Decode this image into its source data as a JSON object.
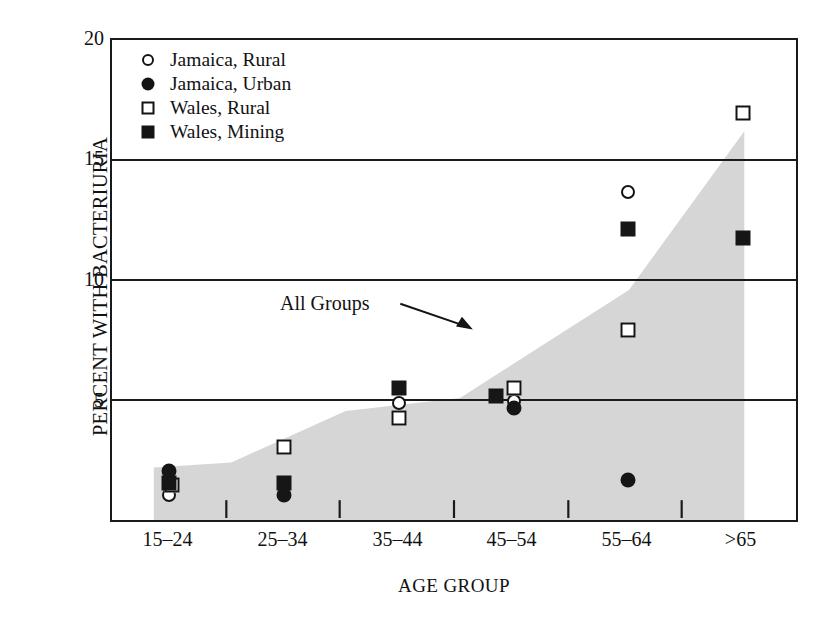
{
  "chart_data": {
    "type": "scatter",
    "title": "",
    "xlabel": "AGE GROUP",
    "ylabel": "PERCENT WITH BACTERIURIA",
    "categories": [
      "15–24",
      "25–34",
      "35–44",
      "45–54",
      "55–64",
      ">65"
    ],
    "ylim": [
      0,
      20
    ],
    "yticks": [
      5,
      10,
      15,
      20
    ],
    "ytick_labels": [
      "5",
      "10",
      "15",
      "20"
    ],
    "grid": "horizontal",
    "legend_position": "top-left",
    "series": [
      {
        "name": "Jamaica, Rural",
        "marker": "open-circle",
        "values": [
          1.2,
          null,
          5.0,
          5.1,
          13.7,
          null
        ]
      },
      {
        "name": "Jamaica, Urban",
        "marker": "filled-circle",
        "values": [
          2.2,
          1.2,
          null,
          4.8,
          1.8,
          null
        ]
      },
      {
        "name": "Wales, Rural",
        "marker": "open-square",
        "values": [
          1.6,
          3.2,
          4.4,
          5.6,
          8.0,
          17.0
        ]
      },
      {
        "name": "Wales, Mining",
        "marker": "filled-square",
        "values": [
          1.7,
          1.7,
          5.6,
          5.3,
          12.2,
          11.8
        ]
      }
    ],
    "shaded_band": {
      "label": "All Groups",
      "fill_color": "#d6d6d6",
      "upper_bound": [
        2.2,
        2.4,
        4.6,
        5.1,
        9.6,
        15.7
      ],
      "lower_bound": [
        0,
        0,
        0,
        0,
        0,
        0
      ]
    },
    "annotations": [
      {
        "text": "All Groups",
        "points_to": "shaded-band"
      }
    ]
  },
  "axes": {
    "y_title": "PERCENT WITH BACTERIURIA",
    "x_title": "AGE GROUP",
    "y_ticks": [
      {
        "label": "20",
        "value": 20
      },
      {
        "label": "15",
        "value": 15
      },
      {
        "label": "10",
        "value": 10
      },
      {
        "label": "5",
        "value": 5
      }
    ],
    "x_ticks": [
      {
        "label": "15–24"
      },
      {
        "label": "25–34"
      },
      {
        "label": "35–44"
      },
      {
        "label": "45–54"
      },
      {
        "label": "55–64"
      },
      {
        "label": ">65"
      }
    ]
  },
  "legend": {
    "items": [
      {
        "label": "Jamaica, Rural",
        "marker": "open-circle",
        "icon": "open-circle-icon"
      },
      {
        "label": "Jamaica, Urban",
        "marker": "filled-circle",
        "icon": "filled-circle-icon"
      },
      {
        "label": "Wales, Rural",
        "marker": "open-square",
        "icon": "open-square-icon"
      },
      {
        "label": "Wales, Mining",
        "marker": "filled-square",
        "icon": "filled-square-icon"
      }
    ]
  },
  "annotation": {
    "all_groups_label": "All Groups"
  },
  "colors": {
    "ink": "#141414",
    "band_fill": "#d6d6d6",
    "background": "#ffffff",
    "gridline": "#1a1a1a"
  }
}
